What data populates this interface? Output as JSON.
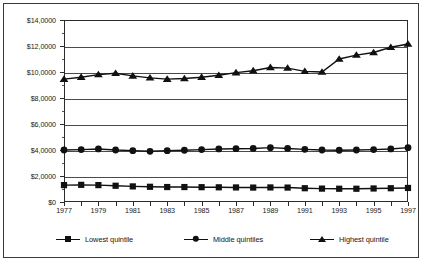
{
  "chart_data": {
    "type": "line",
    "title": "",
    "subtitle": "",
    "xlabel": "",
    "ylabel": "",
    "grid": true,
    "legend_position": "bottom",
    "xlim": [
      1977,
      1997
    ],
    "ylim": [
      0,
      14000
    ],
    "y_ticks": [
      0,
      2000,
      4000,
      6000,
      8000,
      10000,
      12000,
      14000
    ],
    "y_tick_labels": [
      "$0",
      "$2,0000",
      "$4,0000",
      "$6,0000",
      "$8,0000",
      "$10,0000",
      "$12,0000",
      "$14,0000"
    ],
    "y_minor_ticks": [
      1000,
      3000,
      5000,
      7000,
      9000,
      11000,
      13000
    ],
    "x": [
      1977,
      1978,
      1979,
      1980,
      1981,
      1982,
      1983,
      1984,
      1985,
      1986,
      1987,
      1988,
      1989,
      1990,
      1991,
      1992,
      1993,
      1994,
      1995,
      1996,
      1997
    ],
    "x_tick_labels": [
      "1977",
      "1979",
      "1981",
      "1983",
      "1985",
      "1987",
      "1989",
      "1991",
      "1993",
      "1995",
      "1997"
    ],
    "x_tick_values": [
      1977,
      1979,
      1981,
      1983,
      1985,
      1987,
      1989,
      1991,
      1993,
      1995,
      1997
    ],
    "marker_x": [
      1977,
      1978,
      1979,
      1980,
      1981,
      1982,
      1983,
      1984,
      1985,
      1986,
      1987,
      1988,
      1989,
      1990,
      1991,
      1992,
      1993,
      1994,
      1995,
      1996,
      1997
    ],
    "series": [
      {
        "name": "Lowest quintile",
        "marker": "square",
        "color": "#111111",
        "values": [
          1300,
          1320,
          1300,
          1250,
          1200,
          1170,
          1150,
          1150,
          1140,
          1130,
          1120,
          1110,
          1120,
          1110,
          1060,
          1030,
          1020,
          1020,
          1040,
          1060,
          1080
        ]
      },
      {
        "name": "Middle quintiles",
        "marker": "circle",
        "color": "#111111",
        "values": [
          4000,
          4030,
          4080,
          4000,
          3950,
          3900,
          3950,
          3980,
          4030,
          4080,
          4100,
          4120,
          4180,
          4120,
          4050,
          4000,
          3980,
          4000,
          4030,
          4080,
          4180
        ]
      },
      {
        "name": "Highest quintile",
        "marker": "triangle",
        "color": "#111111",
        "values": [
          9450,
          9600,
          9800,
          9900,
          9700,
          9550,
          9450,
          9500,
          9600,
          9750,
          9950,
          10100,
          10350,
          10300,
          10050,
          10000,
          11000,
          11300,
          11500,
          11900,
          12150
        ]
      }
    ]
  },
  "legend": {
    "entries": [
      {
        "label": "Lowest quintile",
        "marker": "square"
      },
      {
        "label": "Middle quintiles",
        "marker": "circle"
      },
      {
        "label": "Highest quintile",
        "marker": "triangle"
      }
    ]
  }
}
